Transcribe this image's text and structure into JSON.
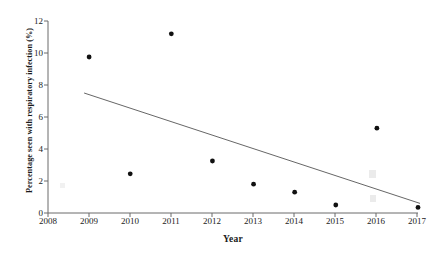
{
  "chart_data": {
    "type": "scatter",
    "title": "",
    "xlabel": "Year",
    "ylabel": "Percentage seen with respiratory infection (%)",
    "x": [
      2009,
      2010,
      2011,
      2012,
      2013,
      2014,
      2015,
      2016,
      2017
    ],
    "values": [
      9.75,
      2.45,
      11.2,
      3.25,
      1.8,
      1.3,
      0.5,
      5.3,
      0.35
    ],
    "series": [
      {
        "name": "Percentage seen with respiratory infection",
        "values": [
          9.75,
          2.45,
          11.2,
          3.25,
          1.8,
          1.3,
          0.5,
          5.3,
          0.35
        ]
      },
      {
        "name": "trendline",
        "type": "line",
        "x": [
          2009,
          2017
        ],
        "values": [
          7.5,
          0.6
        ]
      }
    ],
    "xlim": [
      2008,
      2017
    ],
    "ylim": [
      0,
      12
    ],
    "xticks": [
      2008,
      2009,
      2010,
      2011,
      2012,
      2013,
      2014,
      2015,
      2016,
      2017
    ],
    "xtick_labels": [
      "2008",
      "2009",
      "2010",
      "2011",
      "2012",
      "2013",
      "2014",
      "2015",
      "2016",
      "2017"
    ],
    "yticks": [
      0,
      2,
      4,
      6,
      8,
      10,
      12
    ],
    "ytick_labels": [
      "0",
      "2",
      "4",
      "6",
      "8",
      "10",
      "12"
    ],
    "grid": false,
    "legend": "none",
    "marker": "filled-circle",
    "marker_color": "#111111",
    "trendline_color": "#555555",
    "axis_color": "#6b6b6b",
    "background": "#ffffff"
  }
}
